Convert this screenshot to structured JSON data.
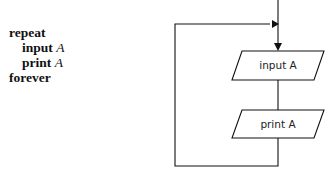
{
  "pseudocode": {
    "line1": "repeat",
    "line2_kw": "input",
    "line2_var": "A",
    "line3_kw": "print",
    "line3_var": "A",
    "line4": "forever"
  },
  "flowchart": {
    "box1_label": "input A",
    "box2_label": "print A"
  }
}
